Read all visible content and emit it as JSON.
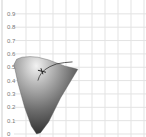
{
  "chart_data": {
    "type": "area",
    "title": "",
    "subtitle": "",
    "xlabel": "",
    "ylabel": "",
    "xlim": [
      0,
      0.7
    ],
    "ylim": [
      0,
      0.9
    ],
    "grid": true,
    "legend": "none",
    "y_ticks": [
      "0",
      "0.1",
      "0.2",
      "0.3",
      "0.4",
      "0.5",
      "0.6",
      "0.7",
      "0.8",
      "0.9"
    ],
    "y_tick_values": [
      0,
      0.1,
      0.2,
      0.3,
      0.4,
      0.5,
      0.6,
      0.7,
      0.8,
      0.9
    ],
    "x_grid_values": [
      0,
      0.1,
      0.2,
      0.3,
      0.4,
      0.5,
      0.6,
      0.7
    ],
    "gamut_outline": {
      "x": [
        0.0,
        0.02,
        0.06,
        0.12,
        0.18,
        0.22,
        0.26,
        0.3,
        0.34,
        0.38,
        0.42,
        0.46,
        0.48,
        0.35,
        0.26,
        0.2,
        0.17,
        0.13,
        0.08,
        0.03,
        0.0
      ],
      "y": [
        0.52,
        0.56,
        0.575,
        0.58,
        0.575,
        0.565,
        0.555,
        0.54,
        0.525,
        0.51,
        0.5,
        0.49,
        0.485,
        0.27,
        0.09,
        0.01,
        0.0,
        0.06,
        0.2,
        0.38,
        0.52
      ]
    },
    "planckian_locus": {
      "x": [
        0.44,
        0.38,
        0.32,
        0.27,
        0.23,
        0.205,
        0.19,
        0.18
      ],
      "y": [
        0.54,
        0.535,
        0.525,
        0.505,
        0.48,
        0.455,
        0.43,
        0.4
      ]
    },
    "white_point": {
      "x": 0.21,
      "y": 0.47
    },
    "colors": {
      "gamut_light": "#d9d9d9",
      "gamut_dark": "#2a2a2a",
      "locus": "#333333",
      "grid": "#e3e3e3",
      "tick_text": "#777777"
    }
  }
}
